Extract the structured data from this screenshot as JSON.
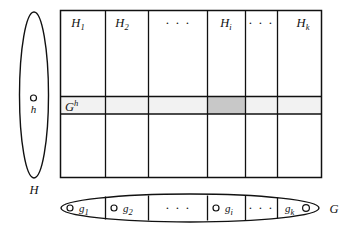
{
  "figure": {
    "background_color": "#ffffff",
    "stroke_color": "#111111",
    "row_highlight_color": "#f2f2f2",
    "cell_highlight_color": "#c8c8c8",
    "width": 352,
    "height": 229
  },
  "left_ellipse": {
    "name": "H",
    "label": "H",
    "element_label": "h",
    "element_dot_name": "h-point"
  },
  "table": {
    "column_headers": [
      {
        "base": "H",
        "sub": "1"
      },
      {
        "base": "H",
        "sub": "2"
      },
      {
        "dots": "· · ·"
      },
      {
        "base": "H",
        "sub": "i"
      },
      {
        "dots": "· · ·"
      },
      {
        "base": "H",
        "sub": "k"
      }
    ],
    "row_label": {
      "base": "G",
      "sup": "h"
    },
    "rows": 3,
    "highlighted_row_index": 1,
    "highlighted_cell_column_index": 3
  },
  "bottom_ellipse": {
    "name": "G",
    "label": "G",
    "cells": [
      {
        "base": "g",
        "sub": "1",
        "dot": "before"
      },
      {
        "base": "g",
        "sub": "2",
        "dot": "before"
      },
      {
        "dots": "· · ·"
      },
      {
        "base": "g",
        "sub": "i",
        "dot": "before"
      },
      {
        "dots": "· · ·"
      },
      {
        "base": "g",
        "sub": "k",
        "dot": "after"
      }
    ]
  }
}
